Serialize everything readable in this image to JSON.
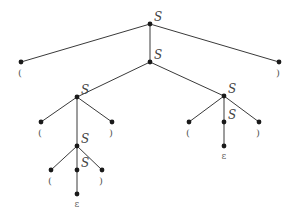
{
  "diagram": {
    "type": "parse-tree",
    "nodes": [
      {
        "id": "n0",
        "x": 150,
        "y": 24,
        "label": "S",
        "kind": "nonterminal"
      },
      {
        "id": "n1",
        "x": 21,
        "y": 62,
        "label": "(",
        "kind": "terminal"
      },
      {
        "id": "n2",
        "x": 150,
        "y": 62,
        "label": "S",
        "kind": "nonterminal"
      },
      {
        "id": "n3",
        "x": 279,
        "y": 62,
        "label": ")",
        "kind": "terminal"
      },
      {
        "id": "n4",
        "x": 77,
        "y": 97,
        "label": "S",
        "kind": "nonterminal"
      },
      {
        "id": "n5",
        "x": 224,
        "y": 96,
        "label": "S",
        "kind": "nonterminal"
      },
      {
        "id": "n6",
        "x": 41,
        "y": 122,
        "label": "(",
        "kind": "terminal"
      },
      {
        "id": "n7",
        "x": 112,
        "y": 122,
        "label": ")",
        "kind": "terminal"
      },
      {
        "id": "n8",
        "x": 77,
        "y": 146,
        "label": "S",
        "kind": "nonterminal"
      },
      {
        "id": "n9",
        "x": 189,
        "y": 122,
        "label": "(",
        "kind": "terminal"
      },
      {
        "id": "n10",
        "x": 224,
        "y": 122,
        "label": "S",
        "kind": "nonterminal"
      },
      {
        "id": "n11",
        "x": 259,
        "y": 122,
        "label": ")",
        "kind": "terminal"
      },
      {
        "id": "n12",
        "x": 224,
        "y": 146,
        "label": "ε",
        "kind": "epsilon"
      },
      {
        "id": "n13",
        "x": 51,
        "y": 170,
        "label": "(",
        "kind": "terminal"
      },
      {
        "id": "n14",
        "x": 77,
        "y": 170,
        "label": "S",
        "kind": "nonterminal"
      },
      {
        "id": "n15",
        "x": 102,
        "y": 170,
        "label": ")",
        "kind": "terminal"
      },
      {
        "id": "n16",
        "x": 77,
        "y": 194,
        "label": "ε",
        "kind": "epsilon"
      }
    ],
    "edges": [
      [
        "n0",
        "n1"
      ],
      [
        "n0",
        "n2"
      ],
      [
        "n0",
        "n3"
      ],
      [
        "n2",
        "n4"
      ],
      [
        "n2",
        "n5"
      ],
      [
        "n4",
        "n6"
      ],
      [
        "n4",
        "n8"
      ],
      [
        "n4",
        "n7"
      ],
      [
        "n5",
        "n9"
      ],
      [
        "n5",
        "n10"
      ],
      [
        "n5",
        "n11"
      ],
      [
        "n10",
        "n12"
      ],
      [
        "n8",
        "n13"
      ],
      [
        "n8",
        "n14"
      ],
      [
        "n8",
        "n15"
      ],
      [
        "n14",
        "n16"
      ]
    ]
  }
}
